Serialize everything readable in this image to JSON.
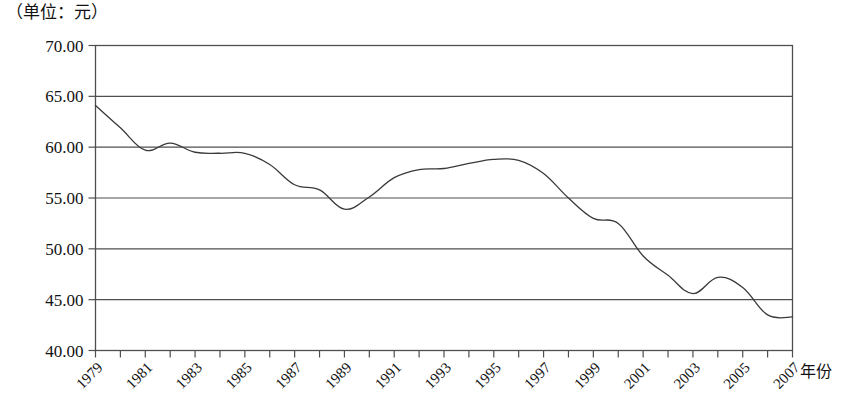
{
  "figure": {
    "unit_label": "（单位：元）",
    "xaxis_title": "年份"
  },
  "chart_data": {
    "type": "line",
    "title": "",
    "subtitle": "",
    "unit_note": "（单位：元）",
    "xlabel": "年份",
    "ylabel": "",
    "ylim": [
      40.0,
      70.0
    ],
    "ytick_step": 5.0,
    "ytick_labels": [
      "70.00",
      "65.00",
      "60.00",
      "55.00",
      "50.00",
      "45.00",
      "40.00"
    ],
    "ytick_values": [
      70.0,
      65.0,
      60.0,
      55.0,
      50.0,
      45.0,
      40.0
    ],
    "xlim": [
      1979,
      2007
    ],
    "xtick_labels": [
      "1979",
      "1981",
      "1983",
      "1985",
      "1987",
      "1989",
      "1991",
      "1993",
      "1995",
      "1997",
      "1999",
      "2001",
      "2003",
      "2005",
      "2007"
    ],
    "xtick_values": [
      1979,
      1981,
      1983,
      1985,
      1987,
      1989,
      1991,
      1993,
      1995,
      1997,
      1999,
      2001,
      2003,
      2005,
      2007
    ],
    "xtick_label_rotation": -45,
    "minor_x_ticks_every": 1,
    "grid": {
      "horizontal": true,
      "vertical": false
    },
    "legend": null,
    "line_color": "#3a3a3a",
    "line_width": 1.3,
    "x": [
      1979,
      1980,
      1981,
      1982,
      1983,
      1984,
      1985,
      1986,
      1987,
      1988,
      1989,
      1990,
      1991,
      1992,
      1993,
      1994,
      1995,
      1996,
      1997,
      1998,
      1999,
      2000,
      2001,
      2002,
      2003,
      2004,
      2005,
      2006,
      2007
    ],
    "values": [
      64.1,
      61.9,
      59.7,
      60.4,
      59.5,
      59.4,
      59.4,
      58.3,
      56.3,
      55.8,
      53.9,
      55.1,
      57.0,
      57.8,
      57.9,
      58.4,
      58.8,
      58.7,
      57.4,
      55.0,
      53.0,
      52.5,
      49.3,
      47.4,
      45.6,
      47.2,
      46.2,
      43.5,
      43.3
    ],
    "series": [
      {
        "name": "",
        "x": [
          1979,
          1980,
          1981,
          1982,
          1983,
          1984,
          1985,
          1986,
          1987,
          1988,
          1989,
          1990,
          1991,
          1992,
          1993,
          1994,
          1995,
          1996,
          1997,
          1998,
          1999,
          2000,
          2001,
          2002,
          2003,
          2004,
          2005,
          2006,
          2007
        ],
        "values": [
          64.1,
          61.9,
          59.7,
          60.4,
          59.5,
          59.4,
          59.4,
          58.3,
          56.3,
          55.8,
          53.9,
          55.1,
          57.0,
          57.8,
          57.9,
          58.4,
          58.8,
          58.7,
          57.4,
          55.0,
          53.0,
          52.5,
          49.3,
          47.4,
          45.6,
          47.2,
          46.2,
          43.5,
          43.3
        ]
      }
    ],
    "annotations": []
  }
}
